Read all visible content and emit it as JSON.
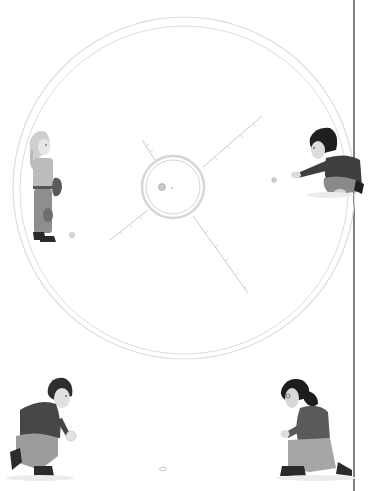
{
  "scene": {
    "description": "Grayscale illustration of four children playing marbles around a large chalk circle",
    "background": "#ffffff",
    "page_edge_line": {
      "x": 354,
      "color": "#2a2a2a"
    },
    "ring": {
      "cx": 185,
      "cy": 188,
      "r_outer": 170,
      "r_inner": 164,
      "color": "#dcdcdc"
    },
    "center_ring": {
      "cx": 173,
      "cy": 187,
      "r": 30,
      "color": "#d8d8d8"
    },
    "spokes": 4,
    "children": [
      {
        "name": "girl-standing-left",
        "pose": "standing"
      },
      {
        "name": "boy-crouching-right",
        "pose": "throwing"
      },
      {
        "name": "boy-kneeling-bottom-left",
        "pose": "kneeling"
      },
      {
        "name": "girl-kneeling-bottom-right",
        "pose": "kneeling"
      }
    ],
    "colors": {
      "sweater_dark": "#4a4a4a",
      "pants_light": "#9a9a9a",
      "skin": "#e0e0e0",
      "hair_dark": "#1e1e1e",
      "hair_blonde": "#c8c8c8"
    }
  }
}
